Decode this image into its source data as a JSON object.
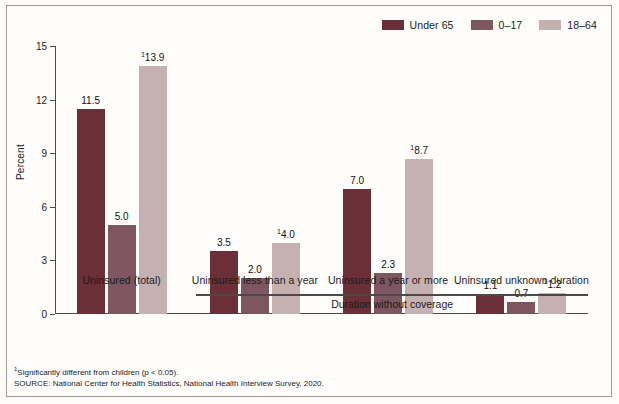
{
  "chart_data": {
    "type": "bar",
    "title": "",
    "xlabel": "Duration without coverage",
    "ylabel": "Percent",
    "ylim": [
      0,
      15
    ],
    "yticks": [
      0,
      3,
      6,
      9,
      12,
      15
    ],
    "grid": false,
    "legend_position": "top-right",
    "categories": [
      "Uninsured (total)",
      "Uninsured less than a year",
      "Uninsured a year or more",
      "Uninsured unknown duration"
    ],
    "series": [
      {
        "name": "Under 65",
        "color": "#6B2F37",
        "values": [
          11.5,
          3.5,
          7.0,
          1.1
        ],
        "labels": [
          "11.5",
          "3.5",
          "7.0",
          "1.1"
        ],
        "significant": [
          false,
          false,
          false,
          false
        ]
      },
      {
        "name": "0–17",
        "color": "#7D5661",
        "values": [
          5.0,
          2.0,
          2.3,
          0.7
        ],
        "labels": [
          "5.0",
          "2.0",
          "2.3",
          "0.7"
        ],
        "significant": [
          false,
          false,
          false,
          false
        ]
      },
      {
        "name": "18–64",
        "color": "#C5B0B2",
        "values": [
          13.9,
          4.0,
          8.7,
          1.2
        ],
        "labels": [
          "13.9",
          "4.0",
          "8.7",
          "1.2"
        ],
        "significant": [
          true,
          true,
          true,
          true
        ]
      }
    ],
    "annotations": [
      "¹Significantly different from children (p < 0.05).",
      "SOURCE: National Center for Health Statistics, National Health Interview Survey, 2020."
    ]
  },
  "footnotes": {
    "significance_marker": "1",
    "significance_text": "Significantly different from children (p < 0.05).",
    "source": "SOURCE: National Center for Health Statistics, National Health Interview Survey, 2020."
  }
}
